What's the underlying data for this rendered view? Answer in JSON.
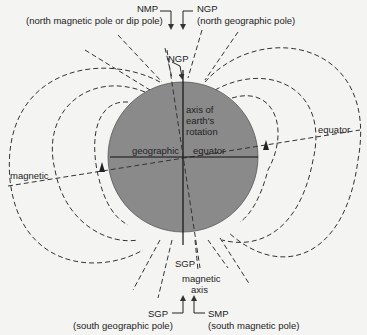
{
  "diagram": {
    "colors": {
      "earth": "#8a8a8a",
      "lines": "#333333",
      "background": "#f4f4f2"
    },
    "labels": {
      "nmp": "NMP",
      "nmp_desc": "(north magnetic pole or dip pole)",
      "ngp_top": "NGP",
      "ngp_desc": "(north geographic pole)",
      "ngp_inner": "NGP",
      "axis_line1": "axis of",
      "axis_line2": "earth's",
      "axis_line3": "rotation",
      "geographic": "geographic",
      "equator_inner": "equator",
      "equator_outer": "equator",
      "magnetic": "magnetic",
      "sgp_inner": "SGP",
      "magnetic_axis_1": "magnetic",
      "magnetic_axis_2": "axis",
      "sgp_bottom": "SGP",
      "sgp_desc": "(south geographic pole)",
      "smp": "SMP",
      "smp_desc": "(south magnetic pole)"
    }
  }
}
